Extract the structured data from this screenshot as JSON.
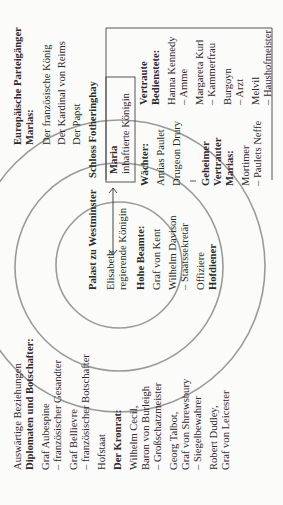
{
  "diagram": {
    "orientation": "rotated 90° counter-clockwise",
    "colors": {
      "circles": "#9a9a9a",
      "lines": "#555555",
      "text": "#2a2a2a",
      "background": "#fbfbfa"
    },
    "foreign": {
      "heading": "Auswärtige Beziehungen",
      "subheading": "Diplomaten und Botschafter:",
      "items": [
        "Graf Aubespine",
        "– französischer Gesandter",
        "Graf Bellievre",
        "– französischer Botschafter"
      ],
      "court_heading": "Hofstaat",
      "council_heading": "Der Kronrat:",
      "council": [
        "Wilhelm Cecil,",
        "Baron von Burleigh",
        "– Großschatzmeister",
        "Georg Talbot,",
        "Graf von Shrewsbury",
        "– Siegelbewahrer",
        "Robert Dudley,",
        "Graf von Leicester"
      ]
    },
    "westminster": {
      "title": "Palast zu Westminster",
      "queen": "Elisabeth",
      "queen_role": "regierende Königin",
      "officials_heading": "Hohe Beamte:",
      "officials": [
        "Graf von Kent",
        "Wilhelm Davison",
        "– Staatssekretär"
      ],
      "officers": "Offiziere",
      "servants": "Hofdiener"
    },
    "guards": {
      "heading": "Wächter:",
      "items": [
        "Amias Paulet",
        "Drugeon Drury"
      ],
      "confidant_heading": [
        "Geheimer",
        "Vertrauter",
        "Marias:"
      ],
      "confidant": [
        "Mortimer",
        "– Paulets Neffe"
      ]
    },
    "fotheringhay": {
      "title": "Schloss Fotheringhay",
      "prisoner": "Maria",
      "prisoner_role": "inhaftierte Königin",
      "servants_heading": [
        "Vertraute",
        "Bedienstete:"
      ],
      "servants": [
        "Hanna Kennedy",
        "– Amme",
        "Margareta Kurl",
        "– Kammerfrau",
        "Burgoyn",
        "– Arzt",
        "Melvil",
        "– Haushofmeister"
      ]
    },
    "supporters": {
      "heading": [
        "Europäische Parteigänger",
        "Marias:"
      ],
      "items": [
        "Der französische König",
        "Der Kardinal von Reims",
        "Der Papst"
      ]
    }
  }
}
